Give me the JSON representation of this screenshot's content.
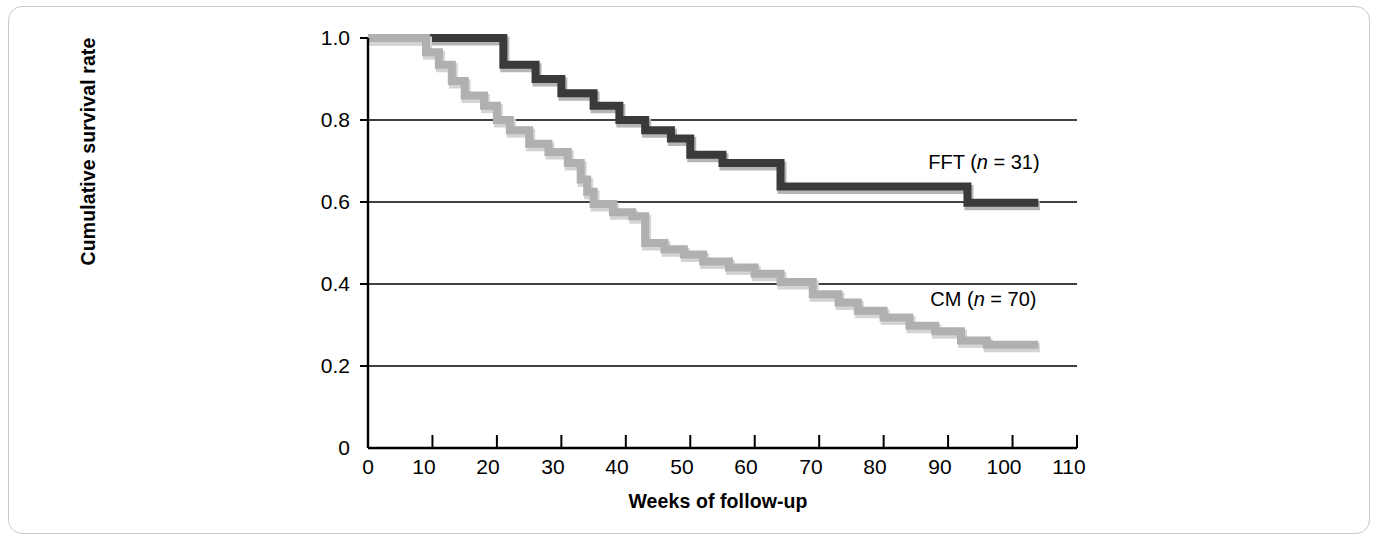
{
  "figure": {
    "kind": "kaplan-meier-survival-plot",
    "background_color": "#ffffff",
    "frame_color": "#c9c9c9"
  },
  "axes": {
    "y_label": "Cumulative survival rate",
    "x_label": "Weeks of follow-up",
    "y_ticks": [
      "1.0",
      "0.8",
      "0.6",
      "0.4",
      "0.2",
      "0"
    ],
    "x_ticks": [
      "0",
      "10",
      "20",
      "30",
      "40",
      "50",
      "60",
      "70",
      "80",
      "90",
      "100",
      "110"
    ],
    "axis_color": "#000000",
    "grid_color": "#000000"
  },
  "legend": {
    "fft": {
      "prefix": "FFT (",
      "n_symbol": "n",
      "equals": " = ",
      "value": "31",
      "suffix": ")"
    },
    "cm": {
      "prefix": "CM (",
      "n_symbol": "n",
      "equals": " = ",
      "value": "70",
      "suffix": ")"
    }
  },
  "chart_data": {
    "type": "line",
    "title": "",
    "xlabel": "Weeks of follow-up",
    "ylabel": "Cumulative survival rate",
    "xlim": [
      0,
      110
    ],
    "ylim": [
      0,
      1.0
    ],
    "x_ticks": [
      0,
      10,
      20,
      30,
      40,
      50,
      60,
      70,
      80,
      90,
      100,
      110
    ],
    "y_ticks": [
      0,
      0.2,
      0.4,
      0.6,
      0.8,
      1.0
    ],
    "grid": "horizontal",
    "legend_position": "inline-right",
    "step_style": "post",
    "series": [
      {
        "name": "FFT (n = 31)",
        "color": "#3a3a3a",
        "shadow_color": "#b5b5b5",
        "label_x": 104,
        "label_y": 0.655,
        "points": [
          [
            0,
            1.0
          ],
          [
            21,
            1.0
          ],
          [
            21,
            0.935
          ],
          [
            26,
            0.935
          ],
          [
            26,
            0.9
          ],
          [
            30,
            0.9
          ],
          [
            30,
            0.865
          ],
          [
            35,
            0.865
          ],
          [
            35,
            0.835
          ],
          [
            39,
            0.835
          ],
          [
            39,
            0.8
          ],
          [
            43,
            0.8
          ],
          [
            43,
            0.775
          ],
          [
            47,
            0.775
          ],
          [
            47,
            0.755
          ],
          [
            50,
            0.755
          ],
          [
            50,
            0.715
          ],
          [
            55,
            0.715
          ],
          [
            55,
            0.695
          ],
          [
            64,
            0.695
          ],
          [
            64,
            0.638
          ],
          [
            93,
            0.638
          ],
          [
            93,
            0.598
          ],
          [
            104,
            0.598
          ]
        ]
      },
      {
        "name": "CM (n = 70)",
        "color": "#b0b0b0",
        "shadow_color": "#d4d4d4",
        "label_x": 104,
        "label_y": 0.318,
        "points": [
          [
            0,
            1.0
          ],
          [
            9,
            1.0
          ],
          [
            9,
            0.965
          ],
          [
            11,
            0.965
          ],
          [
            11,
            0.935
          ],
          [
            13,
            0.935
          ],
          [
            13,
            0.895
          ],
          [
            15,
            0.895
          ],
          [
            15,
            0.86
          ],
          [
            18,
            0.86
          ],
          [
            18,
            0.835
          ],
          [
            20,
            0.835
          ],
          [
            20,
            0.8
          ],
          [
            22,
            0.8
          ],
          [
            22,
            0.775
          ],
          [
            25,
            0.775
          ],
          [
            25,
            0.742
          ],
          [
            28,
            0.742
          ],
          [
            28,
            0.722
          ],
          [
            31,
            0.722
          ],
          [
            31,
            0.695
          ],
          [
            33,
            0.695
          ],
          [
            33,
            0.655
          ],
          [
            34,
            0.655
          ],
          [
            34,
            0.625
          ],
          [
            35,
            0.625
          ],
          [
            35,
            0.595
          ],
          [
            38,
            0.595
          ],
          [
            38,
            0.575
          ],
          [
            41,
            0.575
          ],
          [
            41,
            0.565
          ],
          [
            43,
            0.565
          ],
          [
            43,
            0.5
          ],
          [
            46,
            0.5
          ],
          [
            46,
            0.485
          ],
          [
            49,
            0.485
          ],
          [
            49,
            0.472
          ],
          [
            52,
            0.472
          ],
          [
            52,
            0.455
          ],
          [
            56,
            0.455
          ],
          [
            56,
            0.44
          ],
          [
            60,
            0.44
          ],
          [
            60,
            0.425
          ],
          [
            64,
            0.425
          ],
          [
            64,
            0.405
          ],
          [
            69,
            0.405
          ],
          [
            69,
            0.375
          ],
          [
            73,
            0.375
          ],
          [
            73,
            0.355
          ],
          [
            76,
            0.355
          ],
          [
            76,
            0.335
          ],
          [
            80,
            0.335
          ],
          [
            80,
            0.318
          ],
          [
            84,
            0.318
          ],
          [
            84,
            0.298
          ],
          [
            88,
            0.298
          ],
          [
            88,
            0.285
          ],
          [
            92,
            0.285
          ],
          [
            92,
            0.262
          ],
          [
            96,
            0.262
          ],
          [
            96,
            0.252
          ],
          [
            104,
            0.252
          ]
        ]
      }
    ]
  }
}
